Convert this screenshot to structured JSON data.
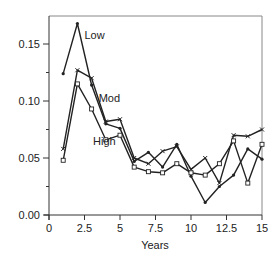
{
  "chart_data": {
    "type": "line",
    "title": "",
    "xlabel": "Years",
    "ylabel": "",
    "xlim": [
      0,
      15
    ],
    "ylim": [
      0,
      0.17
    ],
    "grid": false,
    "legend": "inline labels",
    "xticks": [
      0,
      2.5,
      5,
      7.5,
      10,
      12.5,
      15
    ],
    "xtick_labels": [
      "0",
      "2.5",
      "5",
      "7.5",
      "10",
      "12.5",
      "15"
    ],
    "yticks": [
      0,
      0.05,
      0.1,
      0.15
    ],
    "ytick_labels": [
      "0.00",
      "0.05",
      "0.10",
      "0.15"
    ],
    "x": [
      1,
      2,
      3,
      4,
      5,
      6,
      7,
      8,
      9,
      10,
      11,
      12,
      13,
      14,
      15
    ],
    "series": [
      {
        "name": "Low",
        "marker": "dot",
        "values": [
          0.124,
          0.168,
          0.114,
          0.08,
          0.076,
          0.047,
          0.055,
          0.042,
          0.062,
          0.034,
          0.011,
          0.025,
          0.035,
          0.058,
          0.049
        ]
      },
      {
        "name": "Mod",
        "marker": "x",
        "values": [
          0.058,
          0.127,
          0.12,
          0.082,
          0.084,
          0.05,
          0.045,
          0.056,
          0.06,
          0.04,
          0.05,
          0.028,
          0.07,
          0.069,
          0.075
        ]
      },
      {
        "name": "High",
        "marker": "square",
        "values": [
          0.048,
          0.115,
          0.093,
          0.066,
          0.07,
          0.042,
          0.038,
          0.037,
          0.045,
          0.037,
          0.035,
          0.045,
          0.065,
          0.028,
          0.062
        ]
      }
    ],
    "annotations": [
      {
        "text": "Low",
        "x": 2.5,
        "y": 0.158
      },
      {
        "text": "Mod",
        "x": 3.5,
        "y": 0.103
      },
      {
        "text": "High",
        "x": 3.1,
        "y": 0.065
      }
    ]
  },
  "colors": {
    "line": "#222222",
    "axis": "#333333",
    "frame": "#888888",
    "background": "#ffffff"
  }
}
